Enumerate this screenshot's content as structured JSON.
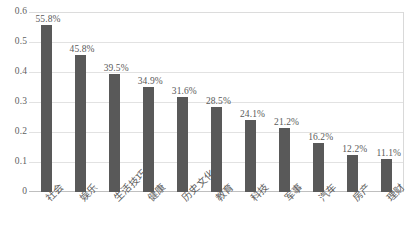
{
  "chart_data": {
    "type": "bar",
    "title": "",
    "subtitle": "",
    "xlabel": "",
    "ylabel": "",
    "categories": [
      "社会",
      "娱乐",
      "生活技巧",
      "健康",
      "历史文化",
      "教育",
      "科技",
      "军事",
      "汽车",
      "房产",
      "理财"
    ],
    "values": [
      0.558,
      0.458,
      0.395,
      0.349,
      0.316,
      0.285,
      0.241,
      0.212,
      0.162,
      0.122,
      0.111
    ],
    "data_labels": [
      "55.8%",
      "45.8%",
      "39.5%",
      "34.9%",
      "31.6%",
      "28.5%",
      "24.1%",
      "21.2%",
      "16.2%",
      "12.2%",
      "11.1%"
    ],
    "ylim": [
      0,
      0.6
    ],
    "ytick_labels": [
      "0.6",
      "0.5",
      "0.4",
      "0.3",
      "0.2",
      "0.1",
      "0"
    ],
    "ytick_values": [
      0.6,
      0.5,
      0.4,
      0.3,
      0.2,
      0.1,
      0
    ],
    "grid": true,
    "grid_axis": "y",
    "legend": false,
    "legend_position": "none",
    "series": [
      {
        "name": "占比",
        "values": [
          0.558,
          0.458,
          0.395,
          0.349,
          0.316,
          0.285,
          0.241,
          0.212,
          0.162,
          0.122,
          0.111
        ]
      }
    ],
    "colors": {
      "bar": "#595959",
      "gridline": "#e2e2e2",
      "axis": "#bfbfbf",
      "text": "#595959",
      "background": "#ffffff"
    }
  }
}
